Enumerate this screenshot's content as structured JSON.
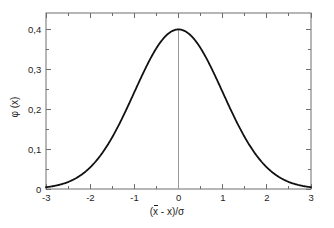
{
  "chart_data": {
    "type": "line",
    "title": "",
    "subtitle": "",
    "xlabel": "(x̄ - x)/σ",
    "xlabel_parts": {
      "lead": "(",
      "xbar": "x",
      "mid": " - ",
      "x": "x",
      "tail": ")/σ"
    },
    "ylabel": "φ (x)",
    "xlim": [
      -3,
      3
    ],
    "ylim": [
      0,
      0.44
    ],
    "xticks": [
      -3,
      -2,
      -1,
      0,
      1,
      2,
      3
    ],
    "xticklabels": [
      "-3",
      "-2",
      "-1",
      "0",
      "1",
      "2",
      "3"
    ],
    "yticks": [
      0,
      0.1,
      0.2,
      0.3,
      0.4
    ],
    "yticklabels": [
      "0",
      "0,1",
      "0,2",
      "0,3",
      "0,4"
    ],
    "minor_xticks": [
      -2.5,
      -1.5,
      -0.5,
      0.5,
      1.5,
      2.5
    ],
    "minor_yticks": [
      0.05,
      0.15,
      0.25,
      0.35
    ],
    "grid": false,
    "legend": null,
    "frame": true,
    "tick_direction": "in",
    "decimal_separator": ",",
    "series": [
      {
        "name": "standard normal density",
        "formula": "phi(x) = (1/sqrt(2*pi)) * exp(-x^2/2)",
        "color": "#111111",
        "linewidth": 1.8,
        "x": [
          -3.0,
          -2.9,
          -2.8,
          -2.7,
          -2.6,
          -2.5,
          -2.4,
          -2.3,
          -2.2,
          -2.1,
          -2.0,
          -1.9,
          -1.8,
          -1.7,
          -1.6,
          -1.5,
          -1.4,
          -1.3,
          -1.2,
          -1.1,
          -1.0,
          -0.9,
          -0.8,
          -0.7,
          -0.6,
          -0.5,
          -0.4,
          -0.3,
          -0.2,
          -0.1,
          0.0,
          0.1,
          0.2,
          0.3,
          0.4,
          0.5,
          0.6,
          0.7,
          0.8,
          0.9,
          1.0,
          1.1,
          1.2,
          1.3,
          1.4,
          1.5,
          1.6,
          1.7,
          1.8,
          1.9,
          2.0,
          2.1,
          2.2,
          2.3,
          2.4,
          2.5,
          2.6,
          2.7,
          2.8,
          2.9,
          3.0
        ],
        "y": [
          0.0044,
          0.006,
          0.0079,
          0.0104,
          0.0136,
          0.0175,
          0.0224,
          0.0283,
          0.0355,
          0.044,
          0.054,
          0.0656,
          0.079,
          0.094,
          0.1109,
          0.1295,
          0.1497,
          0.1714,
          0.1942,
          0.2179,
          0.242,
          0.2661,
          0.2897,
          0.3123,
          0.3332,
          0.3521,
          0.3683,
          0.3814,
          0.391,
          0.397,
          0.3989,
          0.397,
          0.391,
          0.3814,
          0.3683,
          0.3521,
          0.3332,
          0.3123,
          0.2897,
          0.2661,
          0.242,
          0.2179,
          0.1942,
          0.1714,
          0.1497,
          0.1295,
          0.1109,
          0.094,
          0.079,
          0.0656,
          0.054,
          0.044,
          0.0355,
          0.0283,
          0.0224,
          0.0175,
          0.0136,
          0.0104,
          0.0079,
          0.006,
          0.0044
        ]
      }
    ],
    "annotations": [
      {
        "name": "mean-vertical-line",
        "type": "vline",
        "x": 0,
        "y_from": 0,
        "y_to": 0.3989,
        "color": "#9a9a9a",
        "linewidth": 1
      }
    ],
    "peak": {
      "x": 0,
      "y": 0.3989
    },
    "colors": {
      "curve": "#111111",
      "frame": "#6e6e6e",
      "vline": "#9a9a9a",
      "text": "#1c1c1c",
      "background": "#ffffff"
    }
  }
}
